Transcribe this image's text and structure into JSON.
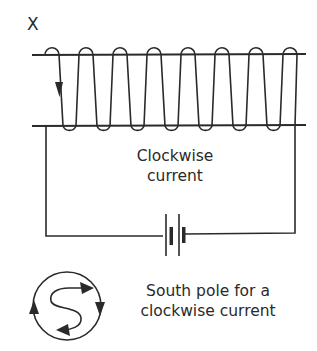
{
  "diagram": {
    "end_label": "X",
    "coil_turns": 8,
    "circuit_label_line1": "Clockwise",
    "circuit_label_line2": "current",
    "pole_caption_line1": "South pole for a",
    "pole_caption_line2": "clockwise current",
    "pole_symbol": "S",
    "current_direction": "clockwise",
    "components": [
      "solenoid-coil",
      "battery",
      "connecting-wires",
      "pole-indicator"
    ],
    "colors": {
      "line": "#2a2a2a",
      "background": "#ffffff"
    }
  }
}
